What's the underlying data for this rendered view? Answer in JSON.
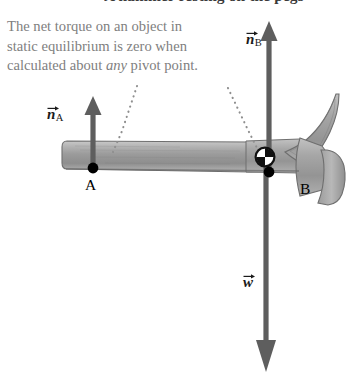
{
  "figure": {
    "clipped_header_text": "A hammer resting on the pegs",
    "caption": {
      "line1": "The net torque on an object in",
      "line2": "static equilibrium is zero when",
      "line3_before": "calculated about ",
      "line3_italic": "any",
      "line3_after": " pivot point."
    },
    "labels": {
      "normal_force_a": "n",
      "normal_force_a_sub": "A",
      "normal_force_b": "n",
      "normal_force_b_sub": "B",
      "weight": "w",
      "point_a": "A",
      "point_b": "B"
    },
    "colors": {
      "caption_text": "#808080",
      "header_text": "#3a3a3a",
      "hammer_fill": "#9a9a9a",
      "hammer_stroke": "#6b6b6b",
      "arrow": "#5e5e5e",
      "pivot_dot": "#000000",
      "leader_dots": "#8a8a8a",
      "background": "#ffffff"
    },
    "physics": {
      "forces": [
        {
          "symbol": "n_A",
          "direction": "up",
          "applied_at": "A",
          "x": 93,
          "tail_y": 168,
          "tip_y": 97
        },
        {
          "symbol": "n_B",
          "direction": "up",
          "applied_at": "B",
          "x": 269,
          "tail_y": 172,
          "tip_y": 22
        },
        {
          "symbol": "w",
          "direction": "down",
          "applied_at": "center of mass",
          "x": 266,
          "tail_y": 158,
          "tip_y": 372
        }
      ],
      "pivot_points": [
        {
          "name": "A",
          "x": 93,
          "y": 168
        },
        {
          "name": "B",
          "x": 269,
          "y": 172
        }
      ],
      "center_of_mass": {
        "x": 265,
        "y": 157
      }
    }
  }
}
